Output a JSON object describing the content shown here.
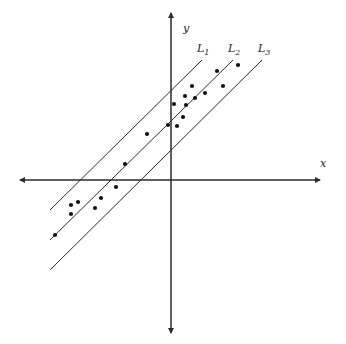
{
  "diagram": {
    "type": "scatter-with-parallel-lines",
    "axes": {
      "x_label": "x",
      "y_label": "y",
      "origin_px": [
        171,
        180
      ],
      "x_axis_px": {
        "from": 20,
        "to": 320
      },
      "y_axis_px": {
        "from": 13,
        "to": 333
      }
    },
    "lines": [
      {
        "label": "L",
        "sub": "1",
        "x1": 50,
        "y1": 210,
        "x2": 202,
        "y2": 60,
        "label_pos": [
          197,
          52
        ]
      },
      {
        "label": "L",
        "sub": "2",
        "x1": 50,
        "y1": 240,
        "x2": 233,
        "y2": 60,
        "label_pos": [
          228,
          52
        ]
      },
      {
        "label": "L",
        "sub": "3",
        "x1": 50,
        "y1": 270,
        "x2": 262,
        "y2": 60,
        "label_pos": [
          258,
          52
        ]
      }
    ],
    "points": [
      [
        238,
        65
      ],
      [
        217,
        71
      ],
      [
        223,
        86
      ],
      [
        192,
        86
      ],
      [
        205,
        93
      ],
      [
        185,
        96
      ],
      [
        174,
        104
      ],
      [
        195,
        98
      ],
      [
        186,
        105
      ],
      [
        183,
        117
      ],
      [
        168,
        125
      ],
      [
        177,
        126
      ],
      [
        147,
        134
      ],
      [
        125,
        164
      ],
      [
        116,
        187
      ],
      [
        101,
        198
      ],
      [
        95,
        208
      ],
      [
        78,
        202
      ],
      [
        71,
        205
      ],
      [
        71,
        214
      ],
      [
        55,
        235
      ]
    ],
    "colors": {
      "stroke": "#2b2b2b",
      "point": "#111111",
      "background": "#ffffff"
    }
  }
}
